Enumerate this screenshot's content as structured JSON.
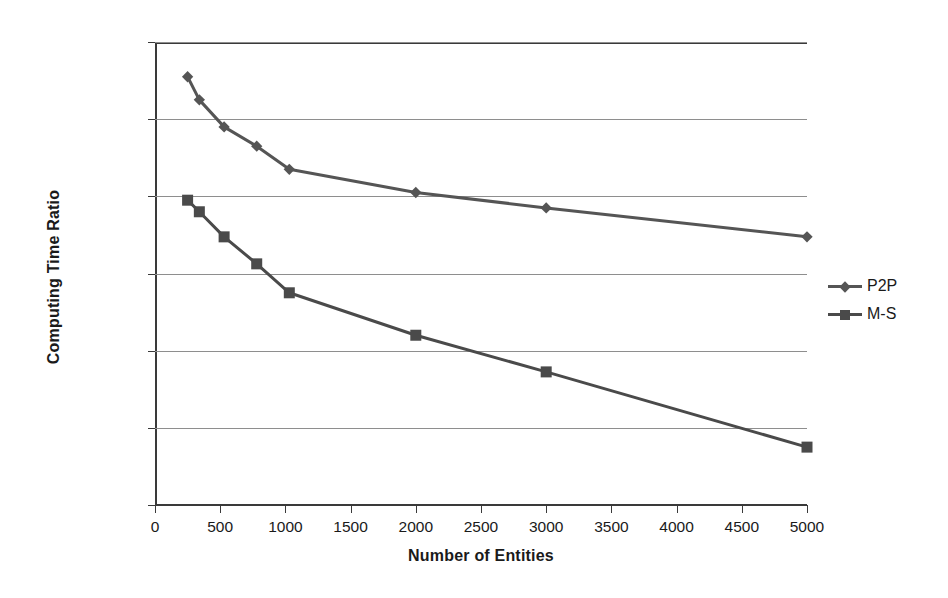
{
  "chart_data": {
    "type": "line",
    "title": "",
    "xlabel": "Number of Entities",
    "ylabel": "Computing Time Ratio",
    "xlim": [
      0,
      5000
    ],
    "ylim": [
      97.6,
      98.8
    ],
    "ytick_format": "comma-decimal-percent",
    "grid": true,
    "legend_position": "right",
    "x_ticks": [
      0,
      500,
      1000,
      1500,
      2000,
      2500,
      3000,
      3500,
      4000,
      4500,
      5000
    ],
    "x_tick_labels": [
      "0",
      "500",
      "1000",
      "1500",
      "2000",
      "2500",
      "3000",
      "3500",
      "4000",
      "4500",
      "5000"
    ],
    "y_ticks": [
      97.6,
      97.8,
      98.0,
      98.2,
      98.4,
      98.6,
      98.8
    ],
    "y_tick_labels": [
      "97,60%",
      "97,80%",
      "98,00%",
      "98,20%",
      "98,40%",
      "98,60%",
      "98,80%"
    ],
    "series": [
      {
        "name": "P2P",
        "marker": "diamond",
        "color": "#555555",
        "x": [
          250,
          340,
          530,
          780,
          1030,
          2000,
          3000,
          5000
        ],
        "values": [
          98.71,
          98.65,
          98.58,
          98.53,
          98.47,
          98.41,
          98.37,
          98.295
        ]
      },
      {
        "name": "M-S",
        "marker": "square",
        "color": "#4a4a4a",
        "x": [
          250,
          340,
          530,
          780,
          1030,
          2000,
          3000,
          5000
        ],
        "values": [
          98.39,
          98.36,
          98.295,
          98.225,
          98.15,
          98.04,
          97.945,
          97.75
        ]
      }
    ]
  },
  "legend": {
    "items": [
      {
        "label": "P2P"
      },
      {
        "label": "M-S"
      }
    ]
  }
}
